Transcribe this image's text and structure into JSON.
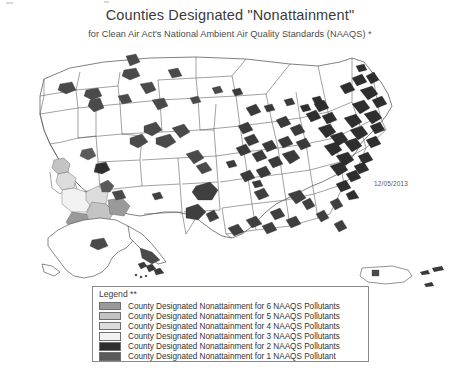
{
  "document": {
    "title": "Counties Designated \"Nonattainment\"",
    "subtitle": "for Clean Air Act's National Ambient Air Quality Standards (NAAQS) *",
    "date_stamp": "12/05/2013"
  },
  "legend": {
    "heading": "Legend **",
    "items": [
      {
        "swatch": "#9a9a9a",
        "label": "County Designated Nonattainment for 6 NAAQS Pollutants",
        "pollutants": 6
      },
      {
        "swatch": "#c4c4c4",
        "label": "County Designated Nonattainment for 5 NAAQS Pollutants",
        "pollutants": 5
      },
      {
        "swatch": "#dcdcdc",
        "label": "County Designated Nonattainment for 4 NAAQS Pollutants",
        "pollutants": 4
      },
      {
        "swatch": "#f2f2f2",
        "label": "County Designated Nonattainment for 3 NAAQS Pollutants",
        "pollutants": 3
      },
      {
        "swatch": "#2e2e2e",
        "label": "County Designated Nonattainment for 2 NAAQS Pollutants",
        "pollutants": 2
      },
      {
        "swatch": "#5a5a5a",
        "label": "County Designated Nonattainment for 1 NAAQS Pollutant",
        "pollutants": 1
      }
    ]
  },
  "map": {
    "name": "united-states-nonattainment-map",
    "colors": {
      "outline": "#4a4a4a",
      "state_border": "#555555",
      "fill": "#ffffff",
      "shade_1": "#5a5a5a",
      "shade_2": "#2e2e2e",
      "shade_3": "#f2f2f2",
      "shade_4": "#dcdcdc",
      "shade_5": "#c4c4c4",
      "shade_6": "#9a9a9a"
    },
    "insets": [
      {
        "name": "alaska",
        "label": ""
      },
      {
        "name": "hawaii",
        "label": ""
      },
      {
        "name": "puerto-rico",
        "label": ""
      }
    ]
  }
}
